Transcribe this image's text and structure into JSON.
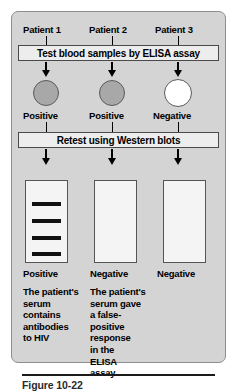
{
  "figure": {
    "caption": "Figure 10-22",
    "columns": [
      {
        "patient_label": "Patient 1",
        "elisa_result": "Positive",
        "elisa_state": "positive",
        "blot_bands": 4,
        "blot_result": "Positive",
        "conclusion_lines": [
          "The patient's",
          "serum",
          "contains",
          "antibodies",
          "to HIV"
        ]
      },
      {
        "patient_label": "Patient 2",
        "elisa_result": "Positive",
        "elisa_state": "positive",
        "blot_bands": 0,
        "blot_result": "Negative",
        "conclusion_lines": [
          "The patient's",
          "serum gave",
          "a false-",
          "positive",
          "response",
          "in the",
          "ELISA",
          "assay"
        ]
      },
      {
        "patient_label": "Patient 3",
        "elisa_result": "Negative",
        "elisa_state": "negative",
        "blot_bands": 0,
        "blot_result": "Negative",
        "conclusion_lines": []
      }
    ],
    "steps": {
      "step1_label": "Test blood samples by ELISA assay",
      "step2_label": "Retest using Western blots"
    },
    "colors": {
      "panel_background": "#d4d4d4",
      "panel_border": "#8e8e8e",
      "banner_background": "#ededed",
      "banner_border": "#4a4a4a",
      "positive_circle": "#a8a8a8",
      "negative_circle": "#ffffff",
      "blot_background": "#f4f4f4",
      "blot_border": "#555555",
      "band_color": "#111111",
      "text_color": "#000000"
    }
  }
}
